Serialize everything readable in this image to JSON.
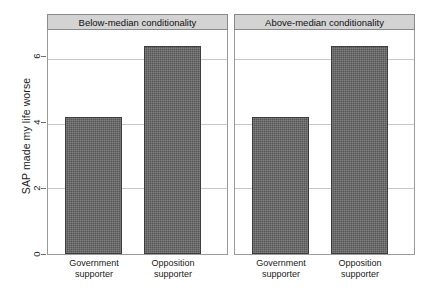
{
  "chart_data": {
    "type": "bar",
    "title": "",
    "xlabel": "",
    "ylabel": "SAP made my life worse",
    "ylim": [
      0,
      6.9
    ],
    "yticks": [
      0,
      2,
      4,
      6
    ],
    "ytick_labels": [
      "0",
      "2",
      "4",
      "6"
    ],
    "grid": "horizontal",
    "legend": "none",
    "categories": [
      "Government supporter",
      "Opposition supporter"
    ],
    "category_lines": [
      [
        "Government",
        "supporter"
      ],
      [
        "Opposition",
        "supporter"
      ]
    ],
    "panels": [
      {
        "title": "Below-median conditionality",
        "values": [
          4.24,
          6.45
        ]
      },
      {
        "title": "Above-median conditionality",
        "values": [
          4.24,
          6.45
        ]
      }
    ],
    "colors": {
      "bar_fill": "#565656",
      "bar_edge": "#3d3d3d",
      "panel_header_bg": "#d3d3d3",
      "panel_border": "#9a9a9a",
      "gridline": "#c8c8c8",
      "text": "#1a1a1a",
      "background": "#ffffff"
    }
  }
}
